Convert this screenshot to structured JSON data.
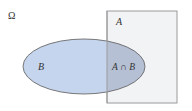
{
  "diagram": {
    "type": "venn",
    "universe": {
      "label": "Ω",
      "x": 13,
      "y": 19
    },
    "sets": {
      "A": {
        "label": "A",
        "shape": "rectangle",
        "fill": "#f2f3f5",
        "stroke": "#9a9a9a"
      },
      "B": {
        "label": "B",
        "shape": "ellipse",
        "fill": "#c5d5ee",
        "stroke": "#6a6a6a"
      }
    },
    "intersection": {
      "label": "A ∩ B",
      "fill": "#b6c0d4"
    }
  }
}
